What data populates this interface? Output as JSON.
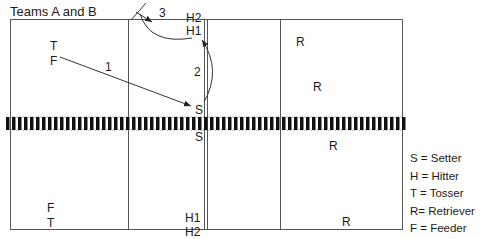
{
  "title": "Teams A and B",
  "colors": {
    "line": "#555555",
    "net": "#111111",
    "text": "#1a1a1a"
  },
  "players": {
    "top_left_T": "T",
    "top_left_F": "F",
    "top_H2": "H2",
    "top_H1": "H1",
    "top_S": "S",
    "bottom_S": "S",
    "bottom_left_F": "F",
    "bottom_left_T": "T",
    "bottom_H1": "H1",
    "bottom_H2": "H2",
    "top_right_R1": "R",
    "top_right_R2": "R",
    "bottom_right_R1": "R",
    "bottom_right_R2": "R"
  },
  "arrows": [
    {
      "label": "1",
      "from": "F",
      "to": "S"
    },
    {
      "label": "2",
      "from": "S",
      "to": "H1"
    },
    {
      "label": "3",
      "from": "H1",
      "to": "over net"
    }
  ],
  "legend": [
    {
      "key": "S",
      "text": "S = Setter"
    },
    {
      "key": "H",
      "text": "H = Hitter"
    },
    {
      "key": "T",
      "text": "T = Tosser"
    },
    {
      "key": "R",
      "text": "R= Retriever"
    },
    {
      "key": "F",
      "text": "F = Feeder"
    }
  ]
}
